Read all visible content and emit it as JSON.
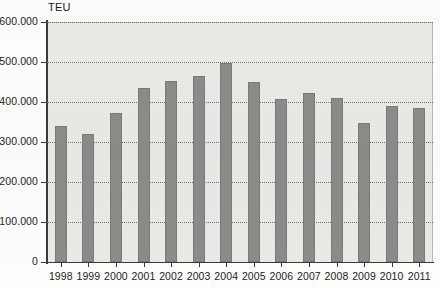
{
  "chart_data": {
    "type": "bar",
    "title": "",
    "subtitle": "",
    "unit_caption": "TEU",
    "xlabel": "",
    "ylabel": "TEU",
    "ylim": [
      0,
      600000
    ],
    "grid": true,
    "legend": "none",
    "categories": [
      "1998",
      "1999",
      "2000",
      "2001",
      "2002",
      "2003",
      "2004",
      "2005",
      "2006",
      "2007",
      "2008",
      "2009",
      "2010",
      "2011"
    ],
    "values": [
      340000,
      320000,
      373000,
      435000,
      452000,
      465000,
      497000,
      450000,
      408000,
      422000,
      410000,
      348000,
      390000,
      385000
    ],
    "ytick_labels": [
      "0",
      "100.000",
      "200.000",
      "300.000",
      "400.000",
      "500.000",
      "600.000"
    ],
    "ytick_values": [
      0,
      100000,
      200000,
      300000,
      400000,
      500000,
      600000
    ],
    "colors": {
      "bar_fill": "#8b8b89",
      "bar_stroke": "#7a7a78",
      "plot_background": "#e9e9e6",
      "gridline": "#6f6f6c",
      "axis": "#3a3a3a",
      "text": "#1c1c1c",
      "page_background": "#fdfdfc"
    }
  }
}
